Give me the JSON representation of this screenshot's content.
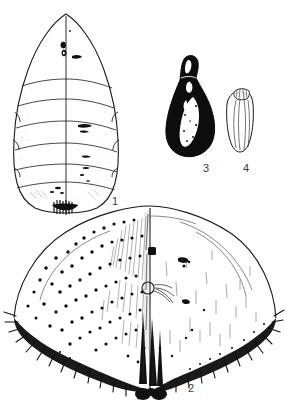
{
  "plate": {
    "title": "Insect life-stage illustration plate",
    "background_color": "#ffffff",
    "ink_color": "#1a1a1a",
    "figures": [
      {
        "number": "1",
        "name": "larva-dorsal-view",
        "description": "Elongate pear-shaped larva in dorsal view with pointed anterior end, segmented body with transverse lines, median longitudinal line, scattered dark markings and a dark posterior cluster"
      },
      {
        "number": "2",
        "name": "scale-cover-dorsal-view",
        "description": "Broad dome-shaped scale cover in dorsal view, fringed with marginal spines, left half densely stippled with dark tubercles, right half with fine setae, median ridge with dark lobes at posterior margin"
      },
      {
        "number": "3",
        "name": "pupa-lateral-view",
        "description": "Solid black teardrop-shaped pupa with narrow neck at anterior end and a pale highlight streak along the body"
      },
      {
        "number": "4",
        "name": "egg-lateral-view",
        "description": "Small elongate oval egg with longitudinal ridges and a textured operculum cap at the top"
      }
    ],
    "labels": {
      "one": "1",
      "two": "2",
      "three": "3",
      "four": "4"
    }
  }
}
